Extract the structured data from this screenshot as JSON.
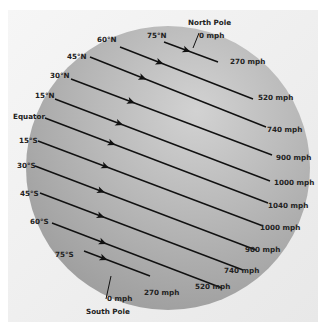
{
  "colors": {
    "background": "#ffffff",
    "panel": "#ededed",
    "globe_light": "#c9c9c9",
    "globe_dark": "#9a9a9a",
    "line": "#111111"
  },
  "globe": {
    "cx": 168,
    "cy": 168,
    "r": 142
  },
  "north_pole": {
    "name": "North Pole",
    "speed": "0 mph"
  },
  "south_pole": {
    "name": "South Pole",
    "speed": "0 mph"
  },
  "latitudes": [
    {
      "label": "75°N",
      "speed": "270 mph",
      "x1": 164,
      "y1": 42,
      "x2": 218,
      "y2": 62,
      "lx": 147,
      "ly": 38,
      "sx": 230,
      "sy": 64
    },
    {
      "label": "60°N",
      "speed": "520 mph",
      "x1": 120,
      "y1": 47,
      "x2": 253,
      "y2": 99,
      "lx": 97,
      "ly": 42,
      "sx": 258,
      "sy": 100
    },
    {
      "label": "45°N",
      "speed": "740 mph",
      "x1": 90,
      "y1": 57,
      "x2": 266,
      "y2": 127,
      "lx": 67,
      "ly": 59,
      "sx": 267,
      "sy": 132
    },
    {
      "label": "30°N",
      "speed": "900 mph",
      "x1": 71,
      "y1": 79,
      "x2": 272,
      "y2": 155,
      "lx": 50,
      "ly": 78,
      "sx": 276,
      "sy": 160
    },
    {
      "label": "15°N",
      "speed": "1000 mph",
      "x1": 55,
      "y1": 99,
      "x2": 270,
      "y2": 181,
      "lx": 35,
      "ly": 98,
      "sx": 274,
      "sy": 185
    },
    {
      "label": "Equator",
      "speed": "1040 mph",
      "x1": 45,
      "y1": 118,
      "x2": 268,
      "y2": 203,
      "lx": 13,
      "ly": 119,
      "sx": 268,
      "sy": 208
    },
    {
      "label": "15°S",
      "speed": "1000 mph",
      "x1": 38,
      "y1": 141,
      "x2": 263,
      "y2": 226,
      "lx": 19,
      "ly": 143,
      "sx": 260,
      "sy": 230
    },
    {
      "label": "30°S",
      "speed": "900 mph",
      "x1": 35,
      "y1": 166,
      "x2": 256,
      "y2": 250,
      "lx": 17,
      "ly": 168,
      "sx": 245,
      "sy": 252
    },
    {
      "label": "45°S",
      "speed": "740 mph",
      "x1": 40,
      "y1": 193,
      "x2": 243,
      "y2": 270,
      "lx": 20,
      "ly": 196,
      "sx": 224,
      "sy": 273
    },
    {
      "label": "60°S",
      "speed": "520 mph",
      "x1": 52,
      "y1": 223,
      "x2": 222,
      "y2": 288,
      "lx": 30,
      "ly": 224,
      "sx": 195,
      "sy": 289
    },
    {
      "label": "75°S",
      "speed": "270 mph",
      "x1": 84,
      "y1": 251,
      "x2": 150,
      "y2": 276,
      "lx": 55,
      "ly": 257,
      "sx": 144,
      "sy": 295
    }
  ]
}
